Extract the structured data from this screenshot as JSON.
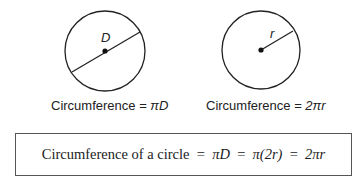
{
  "left_figure": {
    "label": "D",
    "caption_prefix": "Circumference = ",
    "caption_formula": "πD"
  },
  "right_figure": {
    "label": "r",
    "caption_prefix": "Circumference = ",
    "caption_formula": "2πr"
  },
  "summary": {
    "text": "Circumference of a circle = πD = π(2r) = 2πr",
    "prefix": "Circumference of a circle  =  ",
    "part1": "πD",
    "eq": "  =  ",
    "part2": "π(2r)",
    "part3": "2πr"
  },
  "colors": {
    "stroke": "#222222",
    "box_border": "#555555"
  }
}
